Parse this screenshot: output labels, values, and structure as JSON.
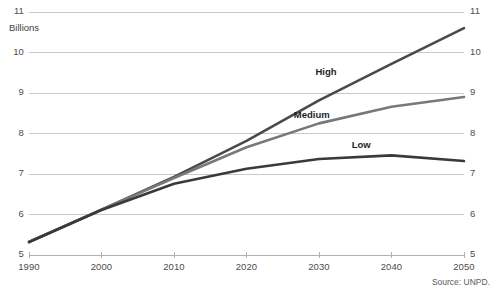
{
  "chart_data": {
    "type": "line",
    "title": "",
    "subtitle": "",
    "unit_label": "Billions",
    "xlabel": "",
    "ylabel": "",
    "x": [
      1990,
      2000,
      2010,
      2020,
      2030,
      2040,
      2050
    ],
    "xlim": [
      1990,
      2050
    ],
    "ylim": [
      5,
      11
    ],
    "xticks": [
      "1990",
      "2000",
      "2010",
      "2020",
      "2030",
      "2040",
      "2050"
    ],
    "yticks": [
      "5",
      "6",
      "7",
      "8",
      "9",
      "10",
      "11"
    ],
    "grid": "horizontal",
    "legend_position": "inline-labels",
    "source": "Source: UNPD.",
    "series": [
      {
        "name": "High",
        "color": "#4a4a4a",
        "values": [
          5.32,
          6.12,
          6.93,
          7.82,
          8.82,
          9.72,
          10.6
        ],
        "label_x": 2032,
        "label_y": 9.52
      },
      {
        "name": "Medium",
        "color": "#787878",
        "values": [
          5.32,
          6.12,
          6.9,
          7.66,
          8.25,
          8.66,
          8.9
        ],
        "label_x": 2029,
        "label_y": 8.45
      },
      {
        "name": "Low",
        "color": "#3a3a3a",
        "values": [
          5.32,
          6.11,
          6.76,
          7.13,
          7.37,
          7.46,
          7.32
        ],
        "label_x": 2037,
        "label_y": 7.72
      }
    ]
  },
  "axis_colors": {
    "gridline": "#c9c9c9",
    "baseline": "#b0b0b0",
    "tick_text": "#4d4d4d"
  }
}
